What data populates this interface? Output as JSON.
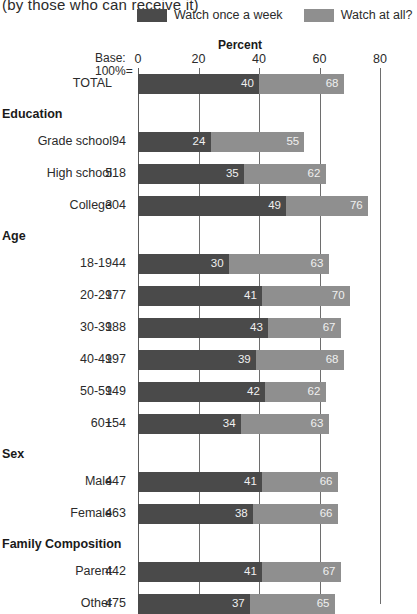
{
  "title": "(by those who can receive it)",
  "legend": {
    "items": [
      {
        "label": "Watch once a week",
        "color": "#4a4a4a",
        "key": "once_a_week"
      },
      {
        "label": "Watch at all?",
        "color": "#8f8f8f",
        "key": "at_all"
      }
    ]
  },
  "axis": {
    "title": "Percent",
    "base_label_line1": "Base:",
    "base_label_line2": "100%=",
    "ticks": [
      "0",
      "20",
      "40",
      "60",
      "80"
    ]
  },
  "colors": {
    "dark": "#4a4a4a",
    "light": "#8f8f8f",
    "gridline": "#6e6e6e",
    "background": "#ffffff"
  },
  "chart_data": {
    "type": "bar",
    "orientation": "horizontal",
    "title": "(by those who can receive it)",
    "xlabel": "Percent",
    "ylabel": "",
    "xlim": [
      0,
      80
    ],
    "xticks": [
      0,
      20,
      40,
      60,
      80
    ],
    "grid": true,
    "legend_position": "top-right",
    "series": [
      {
        "name": "Watch once a week",
        "color": "#4a4a4a"
      },
      {
        "name": "Watch at all?",
        "color": "#8f8f8f"
      }
    ],
    "rows": [
      {
        "kind": "bar",
        "label": "TOTAL",
        "base": "",
        "once_a_week": 40,
        "at_all": 68
      },
      {
        "kind": "group",
        "label": "Education"
      },
      {
        "kind": "bar",
        "label": "Grade school",
        "base": "94",
        "once_a_week": 24,
        "at_all": 55
      },
      {
        "kind": "bar",
        "label": "High school",
        "base": "518",
        "once_a_week": 35,
        "at_all": 62
      },
      {
        "kind": "bar",
        "label": "College",
        "base": "304",
        "once_a_week": 49,
        "at_all": 76
      },
      {
        "kind": "group",
        "label": "Age"
      },
      {
        "kind": "bar",
        "label": "18-19",
        "base": "44",
        "once_a_week": 30,
        "at_all": 63
      },
      {
        "kind": "bar",
        "label": "20-29",
        "base": "177",
        "once_a_week": 41,
        "at_all": 70
      },
      {
        "kind": "bar",
        "label": "30-39",
        "base": "188",
        "once_a_week": 43,
        "at_all": 67
      },
      {
        "kind": "bar",
        "label": "40-49",
        "base": "197",
        "once_a_week": 39,
        "at_all": 68
      },
      {
        "kind": "bar",
        "label": "50-59",
        "base": "149",
        "once_a_week": 42,
        "at_all": 62
      },
      {
        "kind": "bar",
        "label": "60+",
        "base": "154",
        "once_a_week": 34,
        "at_all": 63
      },
      {
        "kind": "group",
        "label": "Sex"
      },
      {
        "kind": "bar",
        "label": "Male",
        "base": "447",
        "once_a_week": 41,
        "at_all": 66
      },
      {
        "kind": "bar",
        "label": "Female",
        "base": "463",
        "once_a_week": 38,
        "at_all": 66
      },
      {
        "kind": "group",
        "label": "Family Composition"
      },
      {
        "kind": "bar",
        "label": "Parent",
        "base": "442",
        "once_a_week": 41,
        "at_all": 67
      },
      {
        "kind": "bar",
        "label": "Other",
        "base": "475",
        "once_a_week": 37,
        "at_all": 65
      }
    ]
  }
}
